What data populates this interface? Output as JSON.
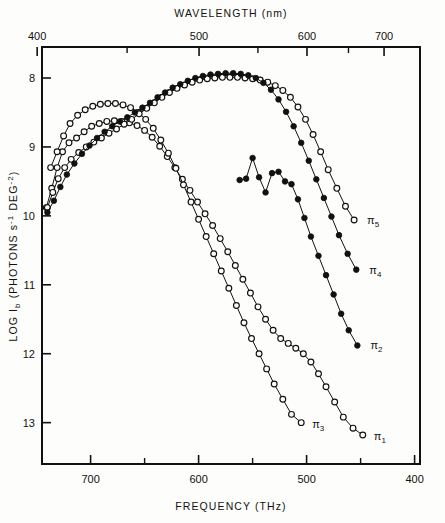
{
  "figure": {
    "top_axis_title": "WAVELENGTH  (nm)",
    "bottom_axis_title": "FREQUENCY  (THz)",
    "y_axis_title_main": "LOG I",
    "y_axis_title_sub": "b",
    "y_axis_title_rest": " (PHOTONS  s",
    "y_axis_title_sup1": "-1",
    "y_axis_title_mid": " DEG",
    "y_axis_title_sup2": "-2",
    "y_axis_title_end": ")"
  },
  "chart_data": {
    "type": "line",
    "title": "",
    "xlabel": "FREQUENCY  (THz)",
    "ylabel": "LOG I_b (PHOTONS s^-1 DEG^-2)",
    "x2label": "WAVELENGTH  (nm)",
    "grid": false,
    "legend_position": "inline-right",
    "x_axis": {
      "name": "frequency_thz",
      "direction": "decreasing-right",
      "range": [
        745,
        395
      ],
      "major_ticks": [
        700,
        600,
        500,
        400
      ],
      "minor_ticks": [
        650,
        550,
        450
      ],
      "tick_labels": [
        "700",
        "600",
        "500",
        "400"
      ]
    },
    "x2_axis": {
      "name": "wavelength_nm",
      "direction": "increasing-right",
      "major_ticks": [
        400,
        500,
        600,
        700
      ],
      "minor_ticks": [
        450,
        550,
        650
      ],
      "tick_labels": [
        "400",
        "500",
        "600",
        "700"
      ]
    },
    "y_axis": {
      "name": "log_Ib",
      "direction": "increasing-down",
      "range": [
        7.55,
        13.6
      ],
      "major_ticks": [
        8,
        9,
        10,
        11,
        12,
        13
      ],
      "tick_labels": [
        "8",
        "9",
        "10",
        "11",
        "12",
        "13"
      ]
    },
    "series": [
      {
        "name": "π₁",
        "label": "π",
        "label_sub": "1",
        "marker": "open-circle",
        "points": [
          [
            741,
            9.88
          ],
          [
            736,
            9.6
          ],
          [
            731,
            9.3
          ],
          [
            726,
            9.07
          ],
          [
            720,
            8.94
          ],
          [
            713,
            8.87
          ],
          [
            706,
            8.78
          ],
          [
            699,
            8.7
          ],
          [
            692,
            8.66
          ],
          [
            685,
            8.63
          ],
          [
            678,
            8.62
          ],
          [
            671,
            8.63
          ],
          [
            664,
            8.65
          ],
          [
            657,
            8.69
          ],
          [
            650,
            8.76
          ],
          [
            643,
            8.86
          ],
          [
            636,
            8.99
          ],
          [
            629,
            9.14
          ],
          [
            622,
            9.3
          ],
          [
            615,
            9.47
          ],
          [
            608,
            9.63
          ],
          [
            601,
            9.8
          ],
          [
            594,
            9.97
          ],
          [
            587,
            10.14
          ],
          [
            580,
            10.33
          ],
          [
            573,
            10.52
          ],
          [
            566,
            10.72
          ],
          [
            559,
            10.92
          ],
          [
            552,
            11.12
          ],
          [
            545,
            11.32
          ],
          [
            538,
            11.5
          ],
          [
            531,
            11.66
          ],
          [
            524,
            11.78
          ],
          [
            517,
            11.85
          ],
          [
            510,
            11.92
          ],
          [
            503,
            12.0
          ],
          [
            496,
            12.12
          ],
          [
            489,
            12.29
          ],
          [
            482,
            12.48
          ],
          [
            474,
            12.7
          ],
          [
            466,
            12.92
          ],
          [
            457,
            13.08
          ],
          [
            448,
            13.18
          ]
        ]
      },
      {
        "name": "π₃",
        "label": "π",
        "label_sub": "3",
        "marker": "open-circle",
        "points": [
          [
            737,
            9.3
          ],
          [
            731,
            9.07
          ],
          [
            725,
            8.84
          ],
          [
            719,
            8.66
          ],
          [
            712,
            8.54
          ],
          [
            705,
            8.46
          ],
          [
            698,
            8.41
          ],
          [
            691,
            8.38
          ],
          [
            684,
            8.37
          ],
          [
            677,
            8.37
          ],
          [
            670,
            8.39
          ],
          [
            663,
            8.43
          ],
          [
            656,
            8.5
          ],
          [
            649,
            8.6
          ],
          [
            642,
            8.73
          ],
          [
            635,
            8.9
          ],
          [
            628,
            9.09
          ],
          [
            621,
            9.31
          ],
          [
            614,
            9.55
          ],
          [
            607,
            9.8
          ],
          [
            600,
            10.05
          ],
          [
            593,
            10.3
          ],
          [
            586,
            10.55
          ],
          [
            579,
            10.8
          ],
          [
            572,
            11.05
          ],
          [
            565,
            11.3
          ],
          [
            558,
            11.55
          ],
          [
            551,
            11.78
          ],
          [
            544,
            12.0
          ],
          [
            537,
            12.22
          ],
          [
            530,
            12.44
          ],
          [
            522,
            12.66
          ],
          [
            514,
            12.88
          ],
          [
            505,
            13.0
          ]
        ]
      },
      {
        "name": "π₅",
        "label": "π",
        "label_sub": "5",
        "marker": "open-circle",
        "points": [
          [
            740,
            9.88
          ],
          [
            735,
            9.66
          ],
          [
            730,
            9.46
          ],
          [
            724,
            9.3
          ],
          [
            718,
            9.18
          ],
          [
            711,
            9.08
          ],
          [
            704,
            9.0
          ],
          [
            697,
            8.93
          ],
          [
            690,
            8.87
          ],
          [
            683,
            8.8
          ],
          [
            676,
            8.74
          ],
          [
            669,
            8.67
          ],
          [
            662,
            8.6
          ],
          [
            655,
            8.52
          ],
          [
            648,
            8.44
          ],
          [
            641,
            8.36
          ],
          [
            634,
            8.28
          ],
          [
            627,
            8.21
          ],
          [
            620,
            8.15
          ],
          [
            613,
            8.1
          ],
          [
            606,
            8.06
          ],
          [
            599,
            8.03
          ],
          [
            592,
            8.01
          ],
          [
            585,
            8.0
          ],
          [
            578,
            7.99
          ],
          [
            571,
            7.99
          ],
          [
            564,
            7.99
          ],
          [
            557,
            8.0
          ],
          [
            550,
            8.01
          ],
          [
            543,
            8.03
          ],
          [
            536,
            8.06
          ],
          [
            529,
            8.11
          ],
          [
            522,
            8.18
          ],
          [
            515,
            8.28
          ],
          [
            508,
            8.42
          ],
          [
            501,
            8.6
          ],
          [
            494,
            8.82
          ],
          [
            487,
            9.07
          ],
          [
            480,
            9.33
          ],
          [
            472,
            9.6
          ],
          [
            464,
            9.86
          ],
          [
            456,
            10.06
          ]
        ]
      },
      {
        "name": "π₄",
        "label": "π",
        "label_sub": "4",
        "marker": "filled-circle",
        "points": [
          [
            740,
            9.95
          ],
          [
            734,
            9.78
          ],
          [
            728,
            9.58
          ],
          [
            722,
            9.4
          ],
          [
            715,
            9.24
          ],
          [
            708,
            9.1
          ],
          [
            701,
            8.98
          ],
          [
            694,
            8.87
          ],
          [
            687,
            8.78
          ],
          [
            680,
            8.7
          ],
          [
            673,
            8.63
          ],
          [
            666,
            8.57
          ],
          [
            659,
            8.5
          ],
          [
            652,
            8.43
          ],
          [
            645,
            8.36
          ],
          [
            638,
            8.28
          ],
          [
            631,
            8.21
          ],
          [
            624,
            8.14
          ],
          [
            617,
            8.09
          ],
          [
            610,
            8.04
          ],
          [
            603,
            8.0
          ],
          [
            596,
            7.97
          ],
          [
            589,
            7.95
          ],
          [
            582,
            7.94
          ],
          [
            575,
            7.93
          ],
          [
            568,
            7.93
          ],
          [
            561,
            7.94
          ],
          [
            554,
            7.96
          ],
          [
            547,
            8.0
          ],
          [
            540,
            8.07
          ],
          [
            533,
            8.17
          ],
          [
            526,
            8.31
          ],
          [
            519,
            8.49
          ],
          [
            512,
            8.7
          ],
          [
            505,
            8.94
          ],
          [
            498,
            9.2
          ],
          [
            491,
            9.47
          ],
          [
            484,
            9.74
          ],
          [
            477,
            10.01
          ],
          [
            470,
            10.28
          ],
          [
            462,
            10.55
          ],
          [
            454,
            10.78
          ]
        ]
      },
      {
        "name": "π₂",
        "label": "π",
        "label_sub": "2",
        "marker": "filled-circle",
        "points": [
          [
            562,
            9.48
          ],
          [
            556,
            9.46
          ],
          [
            550,
            9.16
          ],
          [
            544,
            9.44
          ],
          [
            538,
            9.66
          ],
          [
            532,
            9.38
          ],
          [
            526,
            9.36
          ],
          [
            520,
            9.5
          ],
          [
            514,
            9.54
          ],
          [
            508,
            9.76
          ],
          [
            502,
            10.03
          ],
          [
            496,
            10.3
          ],
          [
            489,
            10.58
          ],
          [
            482,
            10.86
          ],
          [
            475,
            11.14
          ],
          [
            468,
            11.42
          ],
          [
            461,
            11.66
          ],
          [
            453,
            11.88
          ]
        ]
      }
    ]
  }
}
